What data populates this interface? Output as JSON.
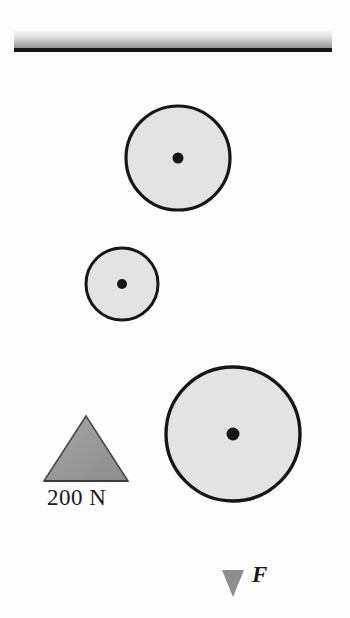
{
  "figure": {
    "type": "pulley-system-diagram",
    "background_color": "#fdfdfd"
  },
  "colors": {
    "rope": "#9a9a9a",
    "pulley_fill": "#e3e3e3",
    "pulley_stroke": "#161616",
    "axle": "#161616",
    "weight_fill": "#9b9b9b",
    "weight_stroke": "#3a3a3a",
    "ceiling_top": "#f2f2f2",
    "ceiling_bottom": "#8f8f8f",
    "ceiling_edge": "#1a1a1a",
    "arrow": "#8e8e8e",
    "text": "#1a1a1a"
  },
  "ceiling": {
    "name": "ceiling-support",
    "x": 14,
    "y": 31,
    "width": 318,
    "height": 21
  },
  "pulleys": [
    {
      "id": "top-pulley",
      "label": "upper fixed pulley",
      "cx": 178,
      "cy": 158,
      "r": 52,
      "axle_r": 5.5
    },
    {
      "id": "small-pulley",
      "label": "small movable pulley",
      "cx": 122,
      "cy": 284,
      "r": 36,
      "axle_r": 5
    },
    {
      "id": "large-pulley",
      "label": "large movable pulley",
      "cx": 233,
      "cy": 434,
      "r": 67,
      "axle_r": 6.5
    }
  ],
  "ropes": [
    {
      "id": "rope-ceiling-to-top-axle",
      "x1": 178,
      "y1": 51,
      "x2": 178,
      "y2": 158
    },
    {
      "id": "rope-ceiling-right-to-large-pulley",
      "x1": 301,
      "y1": 51,
      "x2": 301,
      "y2": 432
    },
    {
      "id": "rope-top-left-to-small-pulley",
      "x1": 127,
      "y1": 158,
      "x2": 127,
      "y2": 284
    },
    {
      "id": "rope-top-right-to-large-pulley",
      "x1": 232,
      "y1": 158,
      "x2": 232,
      "y2": 434
    },
    {
      "id": "rope-small-left-to-weight",
      "x1": 86,
      "y1": 284,
      "x2": 86,
      "y2": 418
    },
    {
      "id": "rope-small-right-to-large-pulley",
      "x1": 158,
      "y1": 284,
      "x2": 158,
      "y2": 430
    },
    {
      "id": "rope-large-axle-to-force",
      "x1": 233,
      "y1": 434,
      "x2": 233,
      "y2": 575
    }
  ],
  "weight": {
    "name": "hanging-weight",
    "label": "200 N",
    "apex_x": 86,
    "apex_y": 416,
    "base_y": 481,
    "half_width": 42
  },
  "force": {
    "name": "applied-force",
    "label": "F",
    "arrow_x": 233,
    "arrow_tip_y": 596,
    "arrow_start_y": 540
  }
}
